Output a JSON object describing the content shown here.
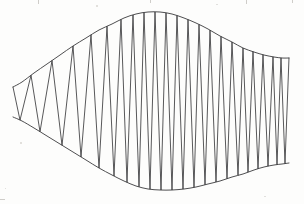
{
  "figure": {
    "title": "",
    "background_color": "#fdfdfc",
    "ink_color": "#3a3a3c",
    "width": 304,
    "height": 204
  },
  "chart_data": {
    "type": "line",
    "title": "",
    "subtitle": "",
    "xlabel": "",
    "ylabel": "",
    "xlim": [
      0,
      304
    ],
    "ylim": [
      204,
      0
    ],
    "grid": false,
    "legend": "none",
    "axes_visible": false,
    "tick_labels_x": [],
    "tick_labels_y": [],
    "annotations": [],
    "series": [
      {
        "name": "upper-envelope",
        "stroke": "#3a3a3c",
        "x": [
          13,
          22,
          34,
          47,
          60,
          73,
          86,
          99,
          112,
          124,
          136,
          148,
          160,
          172,
          184,
          196,
          208,
          220,
          232,
          243,
          254,
          264,
          274,
          282,
          289
        ],
        "y": [
          87,
          82,
          73,
          64,
          55,
          46,
          38,
          30,
          24,
          18,
          14,
          12,
          12,
          14,
          18,
          23,
          29,
          36,
          42,
          48,
          52,
          55,
          57,
          58,
          58
        ]
      },
      {
        "name": "lower-envelope",
        "stroke": "#3a3a3c",
        "x": [
          13,
          22,
          34,
          47,
          60,
          73,
          86,
          99,
          112,
          124,
          136,
          148,
          160,
          172,
          184,
          196,
          208,
          220,
          232,
          243,
          254,
          264,
          274,
          282,
          289
        ],
        "y": [
          117,
          121,
          128,
          136,
          144,
          152,
          160,
          168,
          175,
          181,
          186,
          189,
          190,
          190,
          189,
          187,
          184,
          181,
          177,
          174,
          170,
          167,
          165,
          164,
          163
        ]
      },
      {
        "name": "oscillation",
        "stroke": "#3a3a3c",
        "description": "Zigzag trace alternating between the upper and lower envelope at vertex x positions listed below.",
        "vertex_x": [
          13,
          20,
          31,
          40,
          52,
          62,
          73,
          81,
          91,
          99,
          107,
          114,
          121,
          127,
          133,
          139,
          144,
          150,
          155,
          161,
          166,
          172,
          177,
          183,
          188,
          194,
          199,
          205,
          210,
          216,
          221,
          227,
          232,
          238,
          243,
          248,
          253,
          258,
          263,
          268,
          273,
          277,
          281,
          285,
          289
        ],
        "vertex_side": [
          "top",
          "bottom",
          "top",
          "bottom",
          "top",
          "bottom",
          "top",
          "bottom",
          "top",
          "bottom",
          "top",
          "bottom",
          "top",
          "bottom",
          "top",
          "bottom",
          "top",
          "bottom",
          "top",
          "bottom",
          "top",
          "bottom",
          "top",
          "bottom",
          "top",
          "bottom",
          "top",
          "bottom",
          "top",
          "bottom",
          "top",
          "bottom",
          "top",
          "bottom",
          "top",
          "bottom",
          "top",
          "bottom",
          "top",
          "bottom",
          "top",
          "bottom",
          "top",
          "bottom",
          "top"
        ],
        "cycle_count": 22
      }
    ]
  },
  "artifacts": {
    "specks": [
      {
        "x": 96,
        "y": 5,
        "w": 2,
        "h": 2
      },
      {
        "x": 216,
        "y": 4,
        "w": 2,
        "h": 1
      },
      {
        "x": 20,
        "y": 142,
        "w": 2,
        "h": 2
      },
      {
        "x": 264,
        "y": 196,
        "w": 2,
        "h": 1
      },
      {
        "x": 5,
        "y": 188,
        "w": 1,
        "h": 1
      }
    ],
    "edge_ticks": [
      {
        "x": 38,
        "y": 0,
        "w": 1,
        "h": 4
      },
      {
        "x": 150,
        "y": 0,
        "w": 1,
        "h": 3
      },
      {
        "x": 246,
        "y": 0,
        "w": 1,
        "h": 4
      },
      {
        "x": 292,
        "y": 0,
        "w": 1,
        "h": 3
      },
      {
        "x": 0,
        "y": 199,
        "w": 5,
        "h": 1
      }
    ]
  }
}
